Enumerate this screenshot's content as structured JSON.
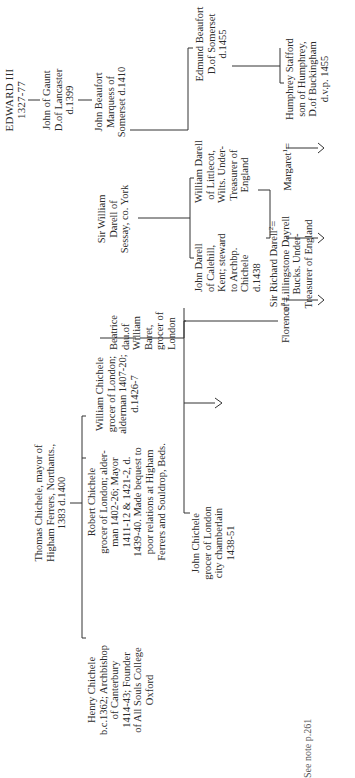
{
  "diagram": {
    "type": "genealogy-tree",
    "orientation": "rotated-90-ccw",
    "people": {
      "edward_iii": {
        "lines": [
          "EDWARD III",
          "1327-77"
        ]
      },
      "john_of_gaunt": {
        "lines": [
          "John of Gaunt",
          "D.of Lancaster",
          "d.1399"
        ]
      },
      "john_beaufort": {
        "lines": [
          "John Beaufort",
          "Marquess of",
          "Somerset d.1410"
        ]
      },
      "edmund_beaufort": {
        "lines": [
          "Edmund Beaufort",
          "D.of Somerset",
          "d.1455"
        ]
      },
      "humphrey_stafford": {
        "lines": [
          "Humphrey Stafford",
          "son of Humphrey,",
          "D.of Buckingham",
          "d.v.p. 1455"
        ]
      },
      "margaret": {
        "name": "Margaret",
        "sup": "1"
      },
      "sir_william_darell": {
        "lines": [
          "Sir William",
          "Darell of",
          "Sessay, co. York"
        ]
      },
      "william_darell_littlecot": {
        "lines": [
          "William Darell",
          "of Littlecot,",
          "Wilts. Under-",
          "Treasurer of",
          "England"
        ]
      },
      "john_darell_calehill": {
        "lines": [
          "John Darell",
          "of Calehill,",
          "Kent; steward",
          "to Archbp.",
          "Chichele",
          "d.1438"
        ]
      },
      "sir_richard_darell": {
        "name": "Sir Richard Darell",
        "sup": "2",
        "lines": [
          "of Lillingstone Dayrell",
          "Bucks. Under-",
          "Treasurer of England"
        ]
      },
      "florence": {
        "name": "Florence",
        "sup": "3"
      },
      "beatrice": {
        "lines": [
          "Beatrice",
          "dau.of",
          "William",
          "Baret,",
          "grocer of",
          "London"
        ]
      },
      "william_chichele": {
        "lines": [
          "William Chichele",
          "grocer of London;",
          "alderman 1407-20;",
          "d.1426-7"
        ]
      },
      "thomas_chichele": {
        "lines": [
          "Thomas Chichele, mayor of",
          "Higham Ferrers, Northants.,",
          "1383 d.1400"
        ]
      },
      "robert_chichele": {
        "lines": [
          "Robert Chichele",
          "grocer of London; alder-",
          "man 1402-26; Mayor",
          "1411-12 & 1421-2, d.",
          "1439-40. Made bequest to",
          "poor relations at Higham",
          "Ferrers and Souldrop, Beds."
        ]
      },
      "john_chichele": {
        "lines": [
          "John Chichele",
          "grocer of London",
          "city chamberlain",
          "1438-51"
        ]
      },
      "henry_chichele": {
        "lines": [
          "Henry Chichele",
          "b.c.1362; Archbishop",
          "of Canterbury",
          "1414-43; Founder",
          "of All Souls College",
          "Oxford"
        ]
      }
    },
    "marriage_symbol": "=",
    "footnote": "See note p.261"
  }
}
